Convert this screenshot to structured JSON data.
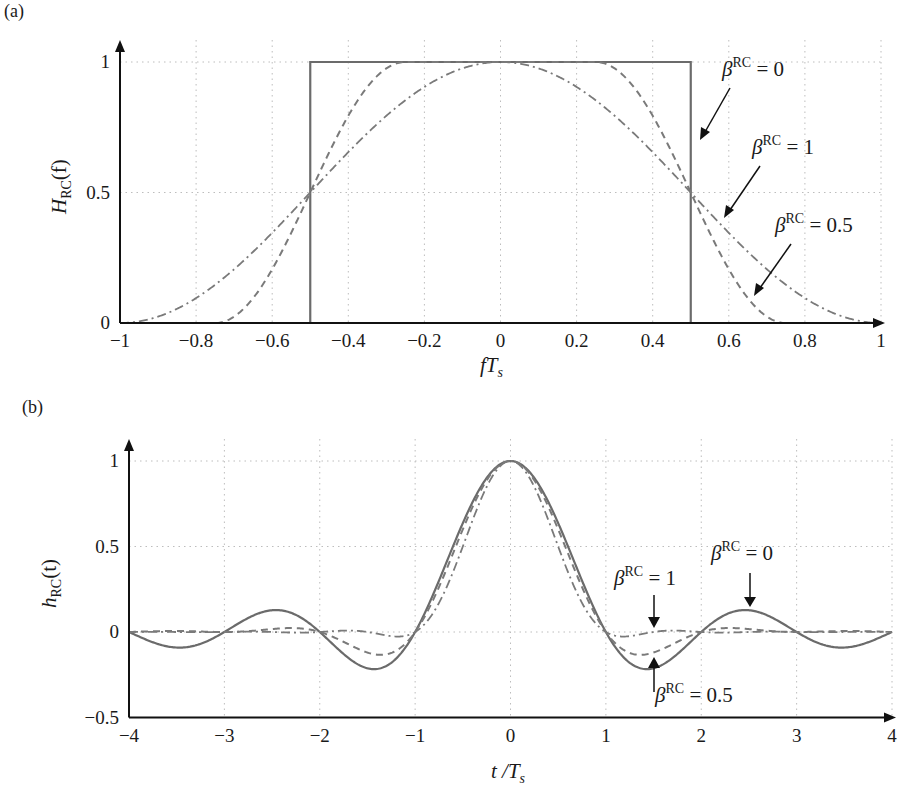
{
  "chart_data": [
    {
      "panel": "(a)",
      "type": "line",
      "title": "",
      "xlabel": "fT_s",
      "ylabel": "H_RC(f)",
      "xlim": [
        -1,
        1
      ],
      "ylim": [
        0,
        1
      ],
      "x_ticks": [
        "−1",
        "−0.8",
        "−0.6",
        "−0.4",
        "−0.2",
        "0",
        "0.2",
        "0.4",
        "0.6",
        "0.8",
        "1"
      ],
      "y_ticks": [
        "0",
        "0.5",
        "1"
      ],
      "grid": true,
      "series": [
        {
          "name": "β^RC = 0",
          "style": "solid",
          "x": [
            -1,
            -0.5,
            -0.5,
            0.5,
            0.5,
            1
          ],
          "values": [
            0,
            0,
            1,
            1,
            0,
            0
          ]
        },
        {
          "name": "β^RC = 0.5",
          "style": "dashed",
          "x": [
            -0.75,
            -0.625,
            -0.5,
            -0.375,
            -0.25,
            0,
            0.25,
            0.375,
            0.5,
            0.625,
            0.75
          ],
          "values": [
            0,
            0.146,
            0.5,
            0.854,
            1,
            1,
            1,
            0.854,
            0.5,
            0.146,
            0
          ]
        },
        {
          "name": "β^RC = 1",
          "style": "dash-dot",
          "x": [
            -1,
            -0.75,
            -0.5,
            -0.25,
            0,
            0.25,
            0.5,
            0.75,
            1
          ],
          "values": [
            0,
            0.146,
            0.5,
            0.854,
            1,
            0.854,
            0.5,
            0.146,
            0
          ]
        }
      ],
      "annotations": [
        {
          "text": "β^RC = 0",
          "points_to": [
            0.51,
            0.7
          ]
        },
        {
          "text": "β^RC = 1",
          "points_to": [
            0.58,
            0.37
          ]
        },
        {
          "text": "β^RC = 0.5",
          "points_to": [
            0.66,
            0.08
          ]
        }
      ]
    },
    {
      "panel": "(b)",
      "type": "line",
      "title": "",
      "xlabel": "t / T_s",
      "ylabel": "h_RC(t)",
      "xlim": [
        -4,
        4
      ],
      "ylim": [
        -0.5,
        1
      ],
      "x_ticks": [
        "−4",
        "−3",
        "−2",
        "−1",
        "0",
        "1",
        "2",
        "3",
        "4"
      ],
      "y_ticks": [
        "−0.5",
        "0",
        "0.5",
        "1"
      ],
      "grid": true,
      "series": [
        {
          "name": "β^RC = 0",
          "style": "solid",
          "x": [
            -4,
            -3.5,
            -3,
            -2.5,
            -2,
            -1.5,
            -1,
            -0.5,
            0,
            0.5,
            1,
            1.5,
            2,
            2.5,
            3,
            3.5,
            4
          ],
          "values": [
            0,
            -0.09,
            0,
            0.127,
            0,
            -0.212,
            0,
            0.637,
            1,
            0.637,
            0,
            -0.212,
            0,
            0.127,
            0,
            -0.09,
            0
          ]
        },
        {
          "name": "β^RC = 0.5",
          "style": "dashed",
          "x": [
            -4,
            -3,
            -2.5,
            -2,
            -1.5,
            -1,
            -0.5,
            0,
            0.5,
            1,
            1.5,
            2,
            2.5,
            3,
            4
          ],
          "values": [
            0,
            0,
            0.02,
            0,
            -0.135,
            0,
            0.57,
            1,
            0.57,
            0,
            -0.135,
            0,
            0.02,
            0,
            0
          ]
        },
        {
          "name": "β^RC = 1",
          "style": "dash-dot",
          "x": [
            -4,
            -2,
            -1.5,
            -1,
            -0.5,
            0,
            0.5,
            1,
            1.5,
            2,
            4
          ],
          "values": [
            0,
            0,
            -0.02,
            0,
            0.5,
            1,
            0.5,
            0,
            -0.02,
            0,
            0
          ]
        }
      ],
      "annotations": [
        {
          "text": "β^RC = 1",
          "points_to": [
            1.5,
            0.0
          ]
        },
        {
          "text": "β^RC = 0",
          "points_to": [
            2.5,
            0.13
          ]
        },
        {
          "text": "β^RC = 0.5",
          "points_to": [
            1.5,
            -0.14
          ]
        }
      ]
    }
  ],
  "labels": {
    "panel_a": "(a)",
    "panel_b": "(b)",
    "a_ylabel_main": "H",
    "a_ylabel_sub": "RC",
    "a_ylabel_arg": "(f)",
    "a_xlabel_main": "fT",
    "a_xlabel_sub": "s",
    "b_ylabel_main": "h",
    "b_ylabel_sub": "RC",
    "b_ylabel_arg": "(t)",
    "b_xlabel_main": "t /T",
    "b_xlabel_sub": "s",
    "beta": "β",
    "rc": "RC",
    "eq0": " = 0",
    "eq1": " = 1",
    "eq05": " = 0.5"
  }
}
